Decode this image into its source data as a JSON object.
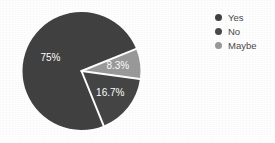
{
  "chart_data": {
    "type": "pie",
    "title": "",
    "categories": [
      "Yes",
      "No",
      "Maybe"
    ],
    "values": [
      75,
      16.7,
      8.3
    ],
    "value_labels": [
      "75%",
      "16.7%",
      "8.3%"
    ],
    "colors": [
      "#414141",
      "#454545",
      "#9a9a9a"
    ],
    "legend_position": "right",
    "grid": false,
    "background": "#ffffff",
    "label_color": "#ffffff",
    "separator_color": "#ffffff",
    "start_angle_deg": 22,
    "slices": [
      {
        "name": "Yes",
        "value": 75,
        "label": "75%",
        "color": "#414141"
      },
      {
        "name": "No",
        "value": 16.7,
        "label": "16.7%",
        "color": "#454545"
      },
      {
        "name": "Maybe",
        "value": 8.3,
        "label": "8.3%",
        "color": "#9a9a9a"
      }
    ]
  },
  "legend": {
    "items": [
      {
        "label": "Yes",
        "color": "#414141"
      },
      {
        "label": "No",
        "color": "#4a4a4a"
      },
      {
        "label": "Maybe",
        "color": "#9a9a9a"
      }
    ]
  },
  "labels": {
    "yes": "75%",
    "no": "16.7%",
    "maybe": "8.3%"
  }
}
